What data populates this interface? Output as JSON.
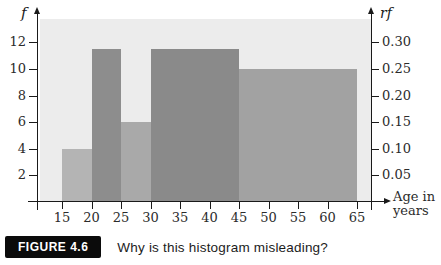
{
  "figure": {
    "caption_badge": "FIGURE 4.6",
    "caption_text": "Why is this histogram misleading?"
  },
  "chart_data": {
    "type": "bar",
    "subtype": "histogram",
    "title": "",
    "grid": false,
    "legend": "none",
    "plot_background": "#ececec",
    "axis_color": "#1a1a1a",
    "x_axis": {
      "label_line1": "Age in",
      "label_line2": "years",
      "ticks": [
        15,
        20,
        25,
        30,
        35,
        40,
        45,
        50,
        55,
        60,
        65
      ],
      "range": [
        15,
        65
      ]
    },
    "y_axis_left": {
      "label": "f",
      "ticks": [
        2,
        4,
        6,
        8,
        10,
        12
      ],
      "range": [
        0,
        13.5
      ]
    },
    "y_axis_right": {
      "label": "rf",
      "ticks": [
        0.05,
        0.1,
        0.15,
        0.2,
        0.25,
        0.3
      ],
      "tick_labels": [
        "0.05",
        "0.10",
        "0.15",
        "0.20",
        "0.25",
        "0.30"
      ],
      "range": [
        0,
        0.3375
      ]
    },
    "classes": [
      {
        "start": 15,
        "end": 20,
        "f": 4,
        "rf": 0.1,
        "color": "#b4b4b4"
      },
      {
        "start": 20,
        "end": 25,
        "f": 11.5,
        "rf": 0.29,
        "color": "#8d8d8d"
      },
      {
        "start": 25,
        "end": 30,
        "f": 6,
        "rf": 0.15,
        "color": "#a9a9a9"
      },
      {
        "start": 30,
        "end": 45,
        "f": 11.5,
        "rf": 0.29,
        "color": "#8a8a8a"
      },
      {
        "start": 45,
        "end": 65,
        "f": 10,
        "rf": 0.25,
        "color": "#a2a2a2"
      }
    ]
  }
}
